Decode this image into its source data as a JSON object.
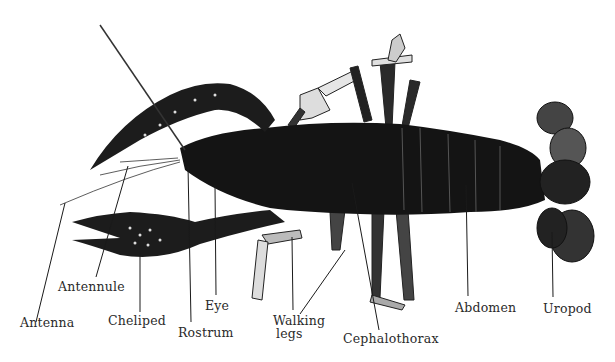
{
  "figure": {
    "colors": {
      "body": "#141414",
      "leg_light": "#d8d8d8",
      "label": "#2a2a2a",
      "leader": "#1a1a1a"
    },
    "labels": [
      {
        "id": "antenna",
        "text": "Antenna",
        "x": 20,
        "y": 323
      },
      {
        "id": "antennule",
        "text": "Antennule",
        "x": 58,
        "y": 278
      },
      {
        "id": "cheliped",
        "text": "Cheliped",
        "x": 107,
        "y": 312
      },
      {
        "id": "rostrum",
        "text": "Rostrum",
        "x": 178,
        "y": 324
      },
      {
        "id": "eye",
        "text": "Eye",
        "x": 205,
        "y": 298
      },
      {
        "id": "walking-legs-1",
        "text": "Walking",
        "x": 273,
        "y": 313
      },
      {
        "id": "walking-legs-2",
        "text": "legs",
        "x": 276,
        "y": 327
      },
      {
        "id": "cephalothorax",
        "text": "Cephalothorax",
        "x": 343,
        "y": 331
      },
      {
        "id": "abdomen",
        "text": "Abdomen",
        "x": 455,
        "y": 300
      },
      {
        "id": "uropod",
        "text": "Uropod",
        "x": 543,
        "y": 301
      }
    ]
  }
}
